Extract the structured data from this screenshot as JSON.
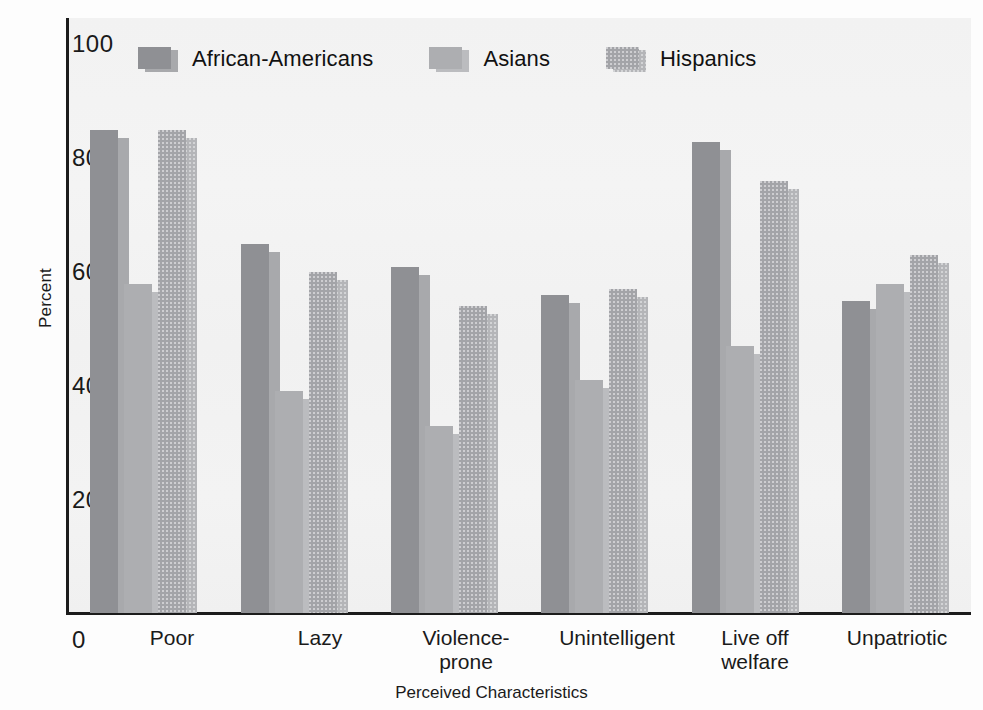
{
  "chart_data": {
    "type": "bar",
    "title": "",
    "subtitle": "",
    "xlabel": "Perceived Characteristics",
    "ylabel": "Percent",
    "ylim": [
      0,
      100
    ],
    "yticks": [
      100,
      80,
      60,
      40,
      20,
      0
    ],
    "ytick_labels": [
      "100",
      "80",
      "60",
      "40",
      "20",
      "0"
    ],
    "grid": false,
    "legend_position": "top-left inside plot",
    "categories": [
      "Poor",
      "Lazy",
      "Violence-\nprone",
      "Unintelligent",
      "Live off\nwelfare",
      "Unpatriotic"
    ],
    "category_lines": [
      [
        "Poor"
      ],
      [
        "Lazy"
      ],
      [
        "Violence-",
        "prone"
      ],
      [
        "Unintelligent"
      ],
      [
        "Live off",
        "welfare"
      ],
      [
        "Unpatriotic"
      ]
    ],
    "series": [
      {
        "name": "African-Americans",
        "color": "#8f9094",
        "values": [
          85,
          65,
          61,
          56,
          83,
          55
        ]
      },
      {
        "name": "Asians",
        "color": "#adaeb1",
        "values": [
          58,
          39,
          33,
          41,
          47,
          58
        ]
      },
      {
        "name": "Hispanics",
        "color": "#a3a4a8",
        "values": [
          85,
          60,
          54,
          57,
          76,
          63
        ]
      }
    ],
    "units": "percent"
  },
  "axes": {
    "y_title": "Percent",
    "x_title": "Perceived Characteristics",
    "y_tick_100": "100",
    "y_tick_80": "80",
    "y_tick_60": "60",
    "y_tick_40": "40",
    "y_tick_20": "20",
    "y_tick_0": "0"
  },
  "legend": {
    "items": [
      {
        "label": "African-Americans",
        "color": "#8f9094",
        "shadow": "#a8a9ac"
      },
      {
        "label": "Asians",
        "color": "#adaeb1",
        "shadow": "#bbbcbf"
      },
      {
        "label": "Hispanics",
        "color": "#a3a4a8",
        "shadow": "#b4b5b8"
      }
    ]
  },
  "xlabels": {
    "c0_l0": "Poor",
    "c1_l0": "Lazy",
    "c2_l0": "Violence-",
    "c2_l1": "prone",
    "c3_l0": "Unintelligent",
    "c4_l0": "Live off",
    "c4_l1": "welfare",
    "c5_l0": "Unpatriotic"
  },
  "colors": {
    "axis": "#1c1c1c",
    "plot_background": "#f2f2f2",
    "page_background": "#fdfdfd",
    "text": "#1a1a1a"
  }
}
